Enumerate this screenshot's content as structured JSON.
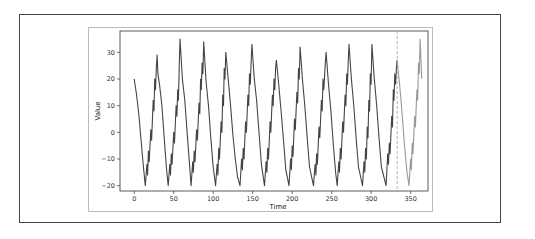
{
  "chart_data": {
    "type": "line",
    "title": "",
    "xlabel": "Time",
    "ylabel": "Value",
    "xlim": [
      -18,
      372
    ],
    "ylim": [
      -22,
      38
    ],
    "xticks": [
      0,
      50,
      100,
      150,
      200,
      250,
      300,
      350
    ],
    "yticks": [
      -20,
      -10,
      0,
      10,
      20,
      30
    ],
    "grid": false,
    "legend": null,
    "split_time": 333,
    "split_line": {
      "style": "dashed",
      "color": "#aaaaaa",
      "x": 333
    },
    "series": [
      {
        "name": "train",
        "color": "#444444",
        "points": [
          [
            0,
            20
          ],
          [
            3,
            14
          ],
          [
            6,
            6
          ],
          [
            9,
            -4
          ],
          [
            12,
            -14
          ],
          [
            14,
            -20
          ],
          [
            16,
            -12
          ],
          [
            17,
            -16
          ],
          [
            18,
            -7
          ],
          [
            19,
            -11
          ],
          [
            21,
            1
          ],
          [
            22,
            -3
          ],
          [
            24,
            12
          ],
          [
            25,
            8
          ],
          [
            26,
            20
          ],
          [
            27,
            16
          ],
          [
            28,
            24
          ],
          [
            29,
            29
          ],
          [
            30,
            22
          ],
          [
            32,
            18
          ],
          [
            35,
            10
          ],
          [
            38,
            -2
          ],
          [
            41,
            -14
          ],
          [
            43,
            -20
          ],
          [
            45,
            -12
          ],
          [
            46,
            -16
          ],
          [
            47,
            -8
          ],
          [
            48,
            -12
          ],
          [
            50,
            0
          ],
          [
            51,
            -4
          ],
          [
            53,
            10
          ],
          [
            54,
            6
          ],
          [
            55,
            16
          ],
          [
            56,
            12
          ],
          [
            57,
            24
          ],
          [
            58,
            35
          ],
          [
            61,
            20
          ],
          [
            64,
            12
          ],
          [
            67,
            0
          ],
          [
            70,
            -12
          ],
          [
            72,
            -20
          ],
          [
            74,
            -11
          ],
          [
            75,
            -15
          ],
          [
            76,
            -7
          ],
          [
            77,
            -11
          ],
          [
            79,
            1
          ],
          [
            80,
            -3
          ],
          [
            82,
            11
          ],
          [
            83,
            7
          ],
          [
            84,
            20
          ],
          [
            85,
            16
          ],
          [
            86,
            26
          ],
          [
            87,
            22
          ],
          [
            88,
            34
          ],
          [
            91,
            19
          ],
          [
            94,
            10
          ],
          [
            97,
            -2
          ],
          [
            100,
            -13
          ],
          [
            103,
            -20
          ],
          [
            105,
            -12
          ],
          [
            106,
            -16
          ],
          [
            107,
            -6
          ],
          [
            108,
            -10
          ],
          [
            110,
            4
          ],
          [
            111,
            0
          ],
          [
            112,
            14
          ],
          [
            113,
            10
          ],
          [
            114,
            24
          ],
          [
            115,
            20
          ],
          [
            116,
            30
          ],
          [
            119,
            20
          ],
          [
            122,
            10
          ],
          [
            125,
            -1
          ],
          [
            128,
            -10
          ],
          [
            131,
            -17
          ],
          [
            134,
            -20
          ],
          [
            136,
            -10
          ],
          [
            137,
            -14
          ],
          [
            138,
            -6
          ],
          [
            139,
            -10
          ],
          [
            141,
            4
          ],
          [
            142,
            0
          ],
          [
            144,
            14
          ],
          [
            145,
            10
          ],
          [
            146,
            22
          ],
          [
            147,
            18
          ],
          [
            148,
            26
          ],
          [
            149,
            33
          ],
          [
            152,
            20
          ],
          [
            155,
            12
          ],
          [
            158,
            0
          ],
          [
            161,
            -12
          ],
          [
            165,
            -20
          ],
          [
            167,
            -11
          ],
          [
            168,
            -15
          ],
          [
            169,
            -6
          ],
          [
            170,
            -10
          ],
          [
            172,
            4
          ],
          [
            173,
            0
          ],
          [
            175,
            14
          ],
          [
            176,
            10
          ],
          [
            177,
            20
          ],
          [
            178,
            16
          ],
          [
            179,
            24
          ],
          [
            180,
            27
          ],
          [
            183,
            18
          ],
          [
            186,
            8
          ],
          [
            189,
            -3
          ],
          [
            192,
            -14
          ],
          [
            196,
            -20
          ],
          [
            198,
            -10
          ],
          [
            199,
            -14
          ],
          [
            200,
            -5
          ],
          [
            201,
            -9
          ],
          [
            203,
            5
          ],
          [
            204,
            1
          ],
          [
            206,
            15
          ],
          [
            207,
            11
          ],
          [
            208,
            24
          ],
          [
            209,
            20
          ],
          [
            210,
            32
          ],
          [
            213,
            20
          ],
          [
            216,
            10
          ],
          [
            219,
            -2
          ],
          [
            222,
            -13
          ],
          [
            227,
            -20
          ],
          [
            229,
            -12
          ],
          [
            230,
            -16
          ],
          [
            231,
            -8
          ],
          [
            232,
            -12
          ],
          [
            234,
            2
          ],
          [
            235,
            -2
          ],
          [
            237,
            12
          ],
          [
            238,
            8
          ],
          [
            239,
            20
          ],
          [
            240,
            16
          ],
          [
            242,
            26
          ],
          [
            243,
            30
          ],
          [
            246,
            18
          ],
          [
            249,
            8
          ],
          [
            252,
            -4
          ],
          [
            255,
            -15
          ],
          [
            257,
            -20
          ],
          [
            259,
            -11
          ],
          [
            260,
            -15
          ],
          [
            261,
            -6
          ],
          [
            262,
            -10
          ],
          [
            264,
            4
          ],
          [
            265,
            0
          ],
          [
            267,
            14
          ],
          [
            268,
            10
          ],
          [
            269,
            22
          ],
          [
            270,
            18
          ],
          [
            271,
            26
          ],
          [
            272,
            33
          ],
          [
            275,
            20
          ],
          [
            278,
            10
          ],
          [
            281,
            -2
          ],
          [
            284,
            -13
          ],
          [
            289,
            -20
          ],
          [
            291,
            -11
          ],
          [
            292,
            -15
          ],
          [
            293,
            -6
          ],
          [
            294,
            -10
          ],
          [
            295,
            2
          ],
          [
            296,
            -2
          ],
          [
            297,
            12
          ],
          [
            298,
            8
          ],
          [
            299,
            22
          ],
          [
            300,
            18
          ],
          [
            301,
            33
          ],
          [
            304,
            20
          ],
          [
            307,
            10
          ],
          [
            310,
            -2
          ],
          [
            313,
            -13
          ],
          [
            319,
            -20
          ],
          [
            321,
            -8
          ],
          [
            322,
            -12
          ],
          [
            323,
            -4
          ],
          [
            324,
            -8
          ],
          [
            326,
            6
          ],
          [
            327,
            2
          ],
          [
            328,
            16
          ],
          [
            329,
            12
          ],
          [
            330,
            22
          ],
          [
            331,
            18
          ],
          [
            332,
            24
          ],
          [
            333,
            27
          ]
        ]
      },
      {
        "name": "test",
        "color": "#999999",
        "points": [
          [
            333,
            27
          ],
          [
            336,
            18
          ],
          [
            339,
            8
          ],
          [
            342,
            -4
          ],
          [
            345,
            -14
          ],
          [
            348,
            -20
          ],
          [
            350,
            -10
          ],
          [
            351,
            -14
          ],
          [
            352,
            -4
          ],
          [
            353,
            -8
          ],
          [
            355,
            6
          ],
          [
            356,
            2
          ],
          [
            358,
            16
          ],
          [
            359,
            12
          ],
          [
            360,
            26
          ],
          [
            361,
            22
          ],
          [
            362,
            35
          ],
          [
            364,
            20
          ]
        ]
      }
    ]
  }
}
